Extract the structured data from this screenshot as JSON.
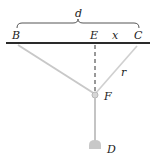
{
  "diagram": {
    "labels": {
      "d": "d",
      "B": "B",
      "E": "E",
      "x": "x",
      "C": "C",
      "r": "r",
      "F": "F",
      "D": "D"
    },
    "colors": {
      "bar": "#2a2a2a",
      "string": "#c8c8c8",
      "rod": "#c4c4c4",
      "weight": "#c8c8c8",
      "dashed": "#333333",
      "brace": "#555555",
      "text": "#222222"
    }
  }
}
